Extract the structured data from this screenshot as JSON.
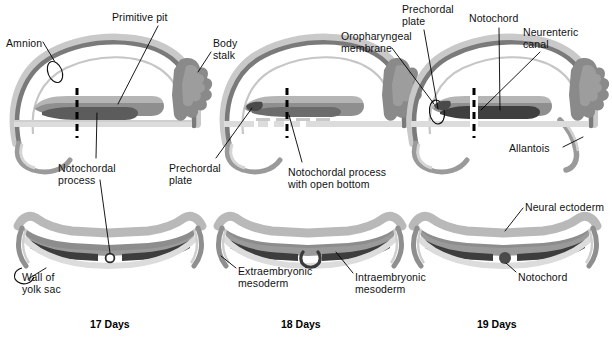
{
  "figure": {
    "type": "embryology-diagram"
  },
  "colors": {
    "outline_dark": "#6e6e6e",
    "ectoderm_mid": "#8f8f8f",
    "amnion_light": "#c9c9c9",
    "notochord_dark": "#3f3f3f",
    "yolk_pale": "#d7d7d7",
    "mesoderm_mid": "#9a9a9a",
    "leader_line": "#000000",
    "text": "#111111",
    "background": "#ffffff"
  },
  "panels": [
    {
      "id": "day17",
      "day_label": "17 Days",
      "day_label_x": 90,
      "day_label_y": 318,
      "top_labels": [
        {
          "name": "amnion",
          "text": "Amnion",
          "x": 6,
          "y": 38
        },
        {
          "name": "primitive-pit",
          "text": "Primitive pit",
          "x": 112,
          "y": 12
        },
        {
          "name": "body-stalk",
          "text": "Body\nstalk",
          "x": 213,
          "y": 38
        },
        {
          "name": "notochordal-process",
          "text": "Notochordal\nprocess",
          "x": 58,
          "y": 163
        }
      ],
      "bottom_labels": [
        {
          "name": "wall-of-yolk-sac",
          "text": "Wall of\nyolk sac",
          "x": 22,
          "y": 272
        }
      ]
    },
    {
      "id": "day18",
      "day_label": "18 Days",
      "day_label_x": 281,
      "day_label_y": 318,
      "top_labels": [
        {
          "name": "prechordal-plate",
          "text": "Prechordal\nplate",
          "x": 169,
          "y": 163
        },
        {
          "name": "notochordal-process-open-bottom",
          "text": "Notochordal process\nwith open bottom",
          "x": 288,
          "y": 167
        },
        {
          "name": "oropharyngeal-membrane",
          "text": "Oropharyngeal\nmembrane",
          "x": 341,
          "y": 31
        }
      ],
      "bottom_labels": [
        {
          "name": "extraembryonic-mesoderm",
          "text": "Extraembryonic\nmesoderm",
          "x": 238,
          "y": 266
        },
        {
          "name": "intraembryonic-mesoderm",
          "text": "Intraembryonic\nmesoderm",
          "x": 355,
          "y": 272
        }
      ]
    },
    {
      "id": "day19",
      "day_label": "19 Days",
      "day_label_x": 477,
      "day_label_y": 318,
      "top_labels": [
        {
          "name": "prechordal-plate-2",
          "text": "Prechordal\nplate",
          "x": 402,
          "y": 4
        },
        {
          "name": "notochord-top",
          "text": "Notochord",
          "x": 469,
          "y": 13
        },
        {
          "name": "neurenteric-canal",
          "text": "Neurenteric\ncanal",
          "x": 523,
          "y": 27
        },
        {
          "name": "allantois",
          "text": "Allantois",
          "x": 509,
          "y": 143
        }
      ],
      "bottom_labels": [
        {
          "name": "neural-ectoderm",
          "text": "Neural ectoderm",
          "x": 525,
          "y": 202
        },
        {
          "name": "notochord-bottom",
          "text": "Notochord",
          "x": 518,
          "y": 272
        }
      ]
    }
  ],
  "section_planes": [
    {
      "name": "section-plane-day17",
      "x": 77,
      "y1": 88,
      "y2": 138
    },
    {
      "name": "section-plane-day18",
      "x": 287,
      "y1": 88,
      "y2": 138
    },
    {
      "name": "section-plane-day19",
      "x": 474,
      "y1": 88,
      "y2": 138
    }
  ]
}
